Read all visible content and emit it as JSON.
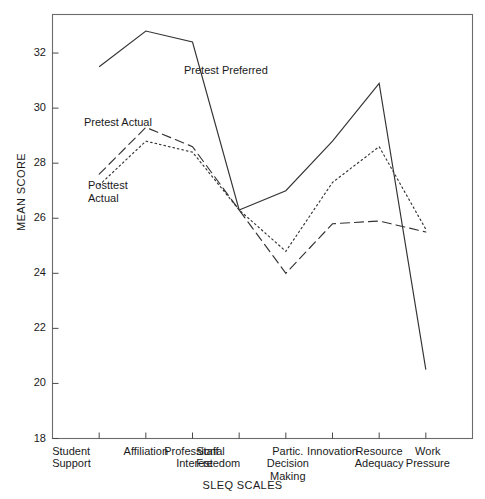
{
  "chart_data": {
    "type": "line",
    "title": "",
    "xlabel": "SLEQ SCALES",
    "ylabel": "MEAN SCORE",
    "ylim": [
      18,
      33.4
    ],
    "yticks": [
      18,
      20,
      22,
      24,
      26,
      28,
      30,
      32
    ],
    "ytick_labels": [
      "18",
      "20",
      "22",
      "24",
      "26",
      "28",
      "30",
      "32"
    ],
    "grid": false,
    "legend_position": "inline-annotations",
    "categories": [
      "Student\nSupport",
      "Affiliation",
      "Professional\nInterest",
      "Staff\nFreedom",
      "Partic.\nDecision\nMaking",
      "Innovation",
      "Resource\nAdequacy",
      "Work\nPressure"
    ],
    "category_labels_flat": [
      "Student Support",
      "Affiliation",
      "Professional Interest",
      "Staff Freedom",
      "Partic. Decision Making",
      "Innovation",
      "Resource Adequacy",
      "Work Pressure"
    ],
    "series": [
      {
        "name": "Pretest Preferred",
        "style": "solid",
        "color": "#333333",
        "values": [
          31.5,
          32.8,
          32.4,
          26.3,
          27.0,
          28.8,
          30.9,
          20.5
        ]
      },
      {
        "name": "Pretest Actual",
        "style": "dashed",
        "color": "#333333",
        "values": [
          27.6,
          29.3,
          28.6,
          26.3,
          24.0,
          25.8,
          25.9,
          25.5
        ]
      },
      {
        "name": "Posttest Actual",
        "style": "dotted",
        "color": "#333333",
        "values": [
          27.2,
          28.8,
          28.4,
          26.3,
          24.8,
          27.3,
          28.6,
          25.6
        ]
      }
    ],
    "annotations": [
      {
        "text": "Pretest Preferred",
        "series": "Pretest Preferred"
      },
      {
        "text": "Pretest Actual",
        "series": "Pretest Actual"
      },
      {
        "text": "Posttest\nActual",
        "series": "Posttest Actual"
      }
    ]
  }
}
